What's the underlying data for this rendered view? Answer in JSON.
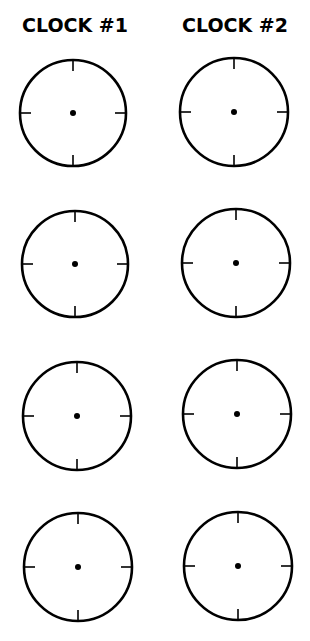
{
  "headings": {
    "clock1": "CLOCK #1",
    "clock2": "CLOCK #2"
  },
  "style": {
    "ink_color": "#000000",
    "background": "#ffffff"
  },
  "clocks": [
    {
      "column": "Clock #1",
      "row": 1,
      "cx": 73,
      "cy": 113,
      "r": 53
    },
    {
      "column": "Clock #2",
      "row": 1,
      "cx": 234,
      "cy": 112,
      "r": 54
    },
    {
      "column": "Clock #1",
      "row": 2,
      "cx": 75,
      "cy": 264,
      "r": 53
    },
    {
      "column": "Clock #2",
      "row": 2,
      "cx": 236,
      "cy": 263,
      "r": 54
    },
    {
      "column": "Clock #1",
      "row": 3,
      "cx": 77,
      "cy": 416,
      "r": 54
    },
    {
      "column": "Clock #2",
      "row": 3,
      "cx": 237,
      "cy": 414,
      "r": 54
    },
    {
      "column": "Clock #1",
      "row": 4,
      "cx": 78,
      "cy": 567,
      "r": 54
    },
    {
      "column": "Clock #2",
      "row": 4,
      "cx": 238,
      "cy": 566,
      "r": 54
    }
  ],
  "clock_face": {
    "tick_marks": [
      "12",
      "3",
      "6",
      "9"
    ],
    "tick_length": 11,
    "center_dot_radius": 3,
    "hands": "none"
  }
}
